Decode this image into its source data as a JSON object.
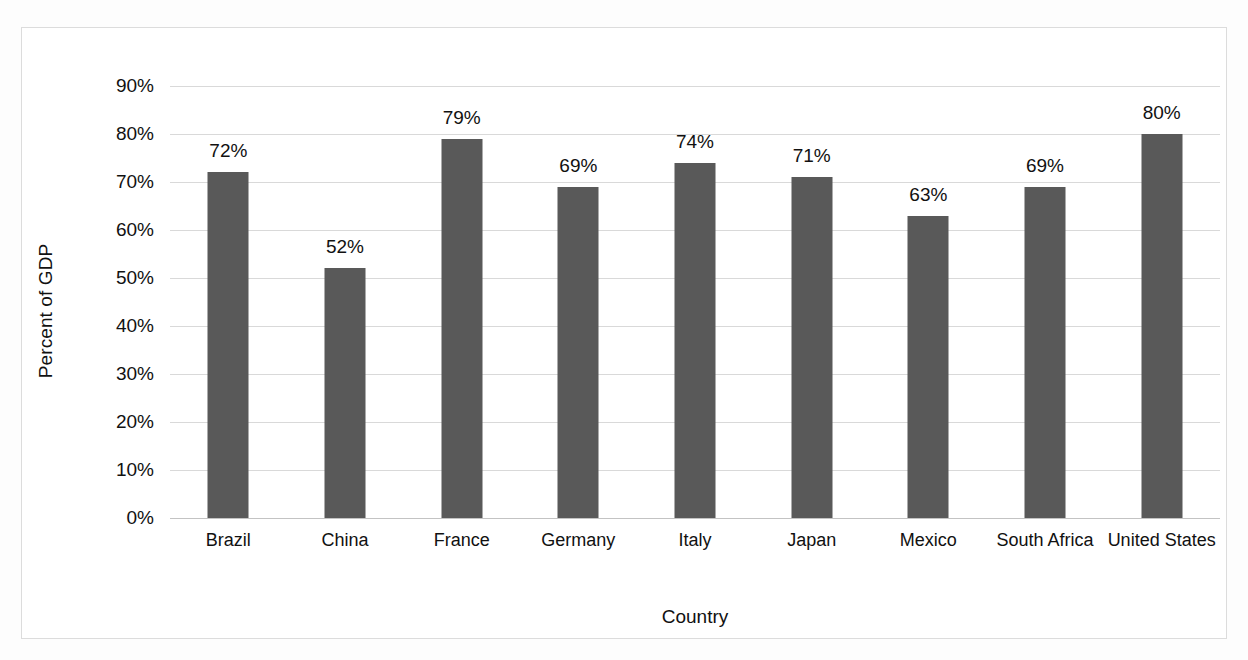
{
  "chart_data": {
    "type": "bar",
    "title": "",
    "subtitle": "",
    "xlabel": "Country",
    "ylabel": "Percent of GDP",
    "categories": [
      "Brazil",
      "China",
      "France",
      "Germany",
      "Italy",
      "Japan",
      "Mexico",
      "South Africa",
      "United States"
    ],
    "values": [
      72,
      52,
      79,
      69,
      74,
      71,
      63,
      69,
      80
    ],
    "data_labels": [
      "72%",
      "52%",
      "79%",
      "69%",
      "74%",
      "71%",
      "63%",
      "69%",
      "80%"
    ],
    "ylim": [
      0,
      90
    ],
    "ytick_values": [
      0,
      10,
      20,
      30,
      40,
      50,
      60,
      70,
      80,
      90
    ],
    "ytick_labels": [
      "0%",
      "10%",
      "20%",
      "30%",
      "40%",
      "50%",
      "60%",
      "70%",
      "80%",
      "90%"
    ],
    "grid": "horizontal",
    "legend": "none",
    "series": [
      {
        "name": "Percent of GDP",
        "color": "#595959",
        "values": [
          72,
          52,
          79,
          69,
          74,
          71,
          63,
          69,
          80
        ]
      }
    ],
    "colors": {
      "bar": "#595959",
      "gridline": "#d9d9d9",
      "axis": "#c3c3c3",
      "text": "#111111",
      "background": "#ffffff",
      "frame": "#dcdcdc"
    }
  }
}
